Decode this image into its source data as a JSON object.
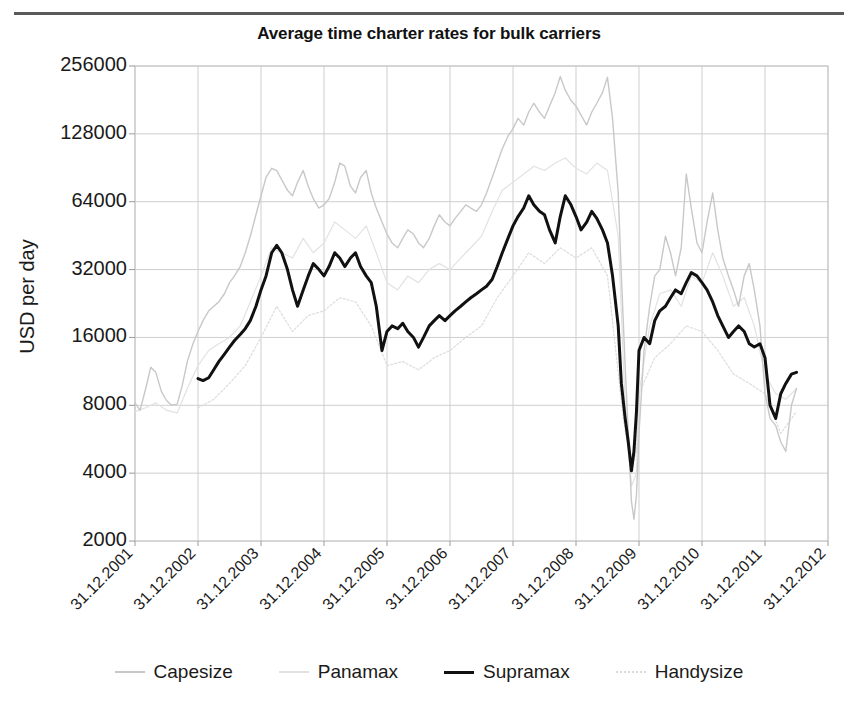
{
  "chart_data": {
    "type": "line",
    "title": "Average time charter rates for bulk carriers",
    "xlabel": "",
    "ylabel": "USD per day",
    "yscale": "log2",
    "ylim": [
      2000,
      256000
    ],
    "yticks": [
      2000,
      4000,
      8000,
      16000,
      32000,
      64000,
      128000,
      256000
    ],
    "ytick_labels": [
      "2000",
      "4000",
      "8000",
      "16000",
      "32000",
      "64000",
      "128000",
      "256000"
    ],
    "xticks": [
      2001,
      2002,
      2003,
      2004,
      2005,
      2006,
      2007,
      2008,
      2009,
      2010,
      2011,
      2012
    ],
    "xtick_labels": [
      "31.12.2001",
      "31.12.2002",
      "31.12.2003",
      "31.12.2004",
      "31.12.2005",
      "31.12.2006",
      "31.12.2007",
      "31.12.2008",
      "31.12.2009",
      "31.12.2010",
      "31.12.2011",
      "31.12.2012"
    ],
    "xlim": [
      2001.0,
      2012.0
    ],
    "grid": true,
    "legend_position": "bottom",
    "series": [
      {
        "name": "Capesize",
        "color": "#c8c8c8",
        "width": 1.4,
        "dash": "none",
        "x": [
          2001.0,
          2001.08,
          2001.17,
          2001.25,
          2001.33,
          2001.42,
          2001.5,
          2001.58,
          2001.67,
          2001.75,
          2001.83,
          2001.92,
          2002.0,
          2002.08,
          2002.17,
          2002.25,
          2002.33,
          2002.42,
          2002.5,
          2002.58,
          2002.67,
          2002.75,
          2002.83,
          2002.92,
          2003.0,
          2003.08,
          2003.17,
          2003.25,
          2003.33,
          2003.42,
          2003.5,
          2003.58,
          2003.67,
          2003.75,
          2003.83,
          2003.92,
          2004.0,
          2004.08,
          2004.17,
          2004.25,
          2004.33,
          2004.42,
          2004.5,
          2004.58,
          2004.67,
          2004.75,
          2004.83,
          2004.92,
          2005.0,
          2005.08,
          2005.17,
          2005.25,
          2005.33,
          2005.42,
          2005.5,
          2005.58,
          2005.67,
          2005.75,
          2005.83,
          2005.92,
          2006.0,
          2006.08,
          2006.17,
          2006.25,
          2006.33,
          2006.42,
          2006.5,
          2006.58,
          2006.67,
          2006.75,
          2006.83,
          2006.92,
          2007.0,
          2007.08,
          2007.17,
          2007.25,
          2007.33,
          2007.42,
          2007.5,
          2007.58,
          2007.67,
          2007.75,
          2007.83,
          2007.92,
          2008.0,
          2008.08,
          2008.17,
          2008.25,
          2008.33,
          2008.42,
          2008.5,
          2008.58,
          2008.67,
          2008.72,
          2008.78,
          2008.83,
          2008.88,
          2008.92,
          2008.96,
          2009.0,
          2009.08,
          2009.17,
          2009.25,
          2009.33,
          2009.42,
          2009.5,
          2009.58,
          2009.67,
          2009.75,
          2009.83,
          2009.92,
          2010.0,
          2010.08,
          2010.17,
          2010.25,
          2010.33,
          2010.42,
          2010.5,
          2010.58,
          2010.67,
          2010.75,
          2010.83,
          2010.92,
          2011.0,
          2011.08,
          2011.17,
          2011.25,
          2011.33,
          2011.42,
          2011.5
        ],
        "y": [
          8200,
          7600,
          9500,
          11800,
          11200,
          9200,
          8400,
          8000,
          8100,
          9800,
          12500,
          15000,
          17000,
          19000,
          21000,
          22000,
          23000,
          25000,
          28000,
          30000,
          33000,
          38000,
          45000,
          56000,
          68000,
          82000,
          90000,
          88000,
          80000,
          72000,
          68000,
          78000,
          88000,
          75000,
          66000,
          60000,
          62000,
          66000,
          78000,
          95000,
          92000,
          75000,
          70000,
          82000,
          88000,
          70000,
          60000,
          52000,
          46000,
          42000,
          40000,
          44000,
          48000,
          46000,
          42000,
          40000,
          44000,
          50000,
          56000,
          52000,
          50000,
          54000,
          58000,
          62000,
          60000,
          58000,
          62000,
          70000,
          82000,
          95000,
          110000,
          125000,
          135000,
          150000,
          140000,
          160000,
          175000,
          160000,
          150000,
          170000,
          195000,
          230000,
          200000,
          180000,
          170000,
          155000,
          140000,
          160000,
          175000,
          195000,
          228000,
          150000,
          70000,
          30000,
          12000,
          6000,
          3000,
          2500,
          3200,
          6000,
          14000,
          22000,
          30000,
          32000,
          45000,
          38000,
          30000,
          40000,
          85000,
          60000,
          42000,
          38000,
          52000,
          70000,
          48000,
          36000,
          30000,
          26000,
          22000,
          30000,
          34000,
          26000,
          18000,
          9000,
          7000,
          6500,
          5500,
          5000,
          8000,
          9500
        ]
      },
      {
        "name": "Panamax",
        "color": "#e2e2e2",
        "width": 1.2,
        "dash": "none",
        "x": [
          2001.0,
          2001.17,
          2001.33,
          2001.5,
          2001.67,
          2001.83,
          2002.0,
          2002.17,
          2002.33,
          2002.5,
          2002.67,
          2002.83,
          2003.0,
          2003.17,
          2003.33,
          2003.5,
          2003.67,
          2003.83,
          2004.0,
          2004.17,
          2004.33,
          2004.5,
          2004.67,
          2004.83,
          2005.0,
          2005.17,
          2005.33,
          2005.5,
          2005.67,
          2005.83,
          2006.0,
          2006.17,
          2006.33,
          2006.5,
          2006.67,
          2006.83,
          2007.0,
          2007.17,
          2007.33,
          2007.5,
          2007.67,
          2007.83,
          2008.0,
          2008.17,
          2008.33,
          2008.5,
          2008.67,
          2008.78,
          2008.88,
          2008.96,
          2009.0,
          2009.17,
          2009.33,
          2009.5,
          2009.67,
          2009.83,
          2010.0,
          2010.17,
          2010.33,
          2010.5,
          2010.67,
          2010.83,
          2011.0,
          2011.17,
          2011.33,
          2011.5
        ],
        "y": [
          7500,
          7800,
          8200,
          7600,
          7400,
          9500,
          12000,
          14000,
          15000,
          16000,
          18000,
          23000,
          30000,
          40000,
          38000,
          36000,
          44000,
          38000,
          42000,
          52000,
          48000,
          44000,
          50000,
          38000,
          28000,
          26000,
          30000,
          28000,
          32000,
          34000,
          32000,
          36000,
          40000,
          45000,
          58000,
          72000,
          78000,
          85000,
          92000,
          88000,
          95000,
          100000,
          90000,
          85000,
          95000,
          88000,
          45000,
          8000,
          3500,
          4000,
          9000,
          18000,
          25000,
          26000,
          22000,
          30000,
          28000,
          38000,
          30000,
          22000,
          24000,
          18000,
          11000,
          9000,
          8500,
          9500
        ]
      },
      {
        "name": "Supramax",
        "color": "#111111",
        "width": 3.0,
        "dash": "none",
        "x": [
          2002.0,
          2002.08,
          2002.17,
          2002.25,
          2002.33,
          2002.42,
          2002.5,
          2002.58,
          2002.67,
          2002.75,
          2002.83,
          2002.92,
          2003.0,
          2003.08,
          2003.17,
          2003.25,
          2003.33,
          2003.42,
          2003.5,
          2003.58,
          2003.67,
          2003.75,
          2003.83,
          2003.92,
          2004.0,
          2004.08,
          2004.17,
          2004.25,
          2004.33,
          2004.42,
          2004.5,
          2004.58,
          2004.67,
          2004.75,
          2004.83,
          2004.92,
          2005.0,
          2005.08,
          2005.17,
          2005.25,
          2005.33,
          2005.42,
          2005.5,
          2005.58,
          2005.67,
          2005.75,
          2005.83,
          2005.92,
          2006.0,
          2006.08,
          2006.17,
          2006.25,
          2006.33,
          2006.42,
          2006.5,
          2006.58,
          2006.67,
          2006.75,
          2006.83,
          2006.92,
          2007.0,
          2007.08,
          2007.17,
          2007.25,
          2007.33,
          2007.42,
          2007.5,
          2007.58,
          2007.67,
          2007.75,
          2007.83,
          2007.92,
          2008.0,
          2008.08,
          2008.17,
          2008.25,
          2008.33,
          2008.42,
          2008.5,
          2008.58,
          2008.67,
          2008.72,
          2008.78,
          2008.83,
          2008.88,
          2008.92,
          2008.96,
          2009.0,
          2009.08,
          2009.17,
          2009.25,
          2009.33,
          2009.42,
          2009.5,
          2009.58,
          2009.67,
          2009.75,
          2009.83,
          2009.92,
          2010.0,
          2010.08,
          2010.17,
          2010.25,
          2010.33,
          2010.42,
          2010.5,
          2010.58,
          2010.67,
          2010.75,
          2010.83,
          2010.92,
          2011.0,
          2011.08,
          2011.17,
          2011.25,
          2011.33,
          2011.42,
          2011.5
        ],
        "y": [
          10500,
          10300,
          10600,
          11500,
          12500,
          13500,
          14500,
          15500,
          16500,
          17500,
          19000,
          22000,
          26000,
          30000,
          38000,
          41000,
          38000,
          32000,
          26000,
          22000,
          26000,
          30000,
          34000,
          32000,
          30000,
          33000,
          38000,
          36000,
          33000,
          36000,
          38000,
          33000,
          30000,
          28000,
          22000,
          14000,
          17000,
          18000,
          17500,
          18500,
          17000,
          16000,
          14500,
          16000,
          18000,
          19000,
          20000,
          19000,
          20000,
          21000,
          22000,
          23000,
          24000,
          25000,
          26000,
          27000,
          29000,
          33000,
          38000,
          44000,
          50000,
          55000,
          60000,
          68000,
          62000,
          58000,
          56000,
          48000,
          42000,
          55000,
          68000,
          62000,
          55000,
          48000,
          52000,
          58000,
          54000,
          48000,
          42000,
          30000,
          18000,
          10000,
          7000,
          5500,
          4100,
          5000,
          7500,
          14000,
          16000,
          15000,
          19000,
          21000,
          22000,
          24000,
          26000,
          25000,
          28000,
          31000,
          30000,
          28000,
          26000,
          23000,
          20000,
          18000,
          16000,
          17000,
          18000,
          17000,
          15000,
          14500,
          15000,
          13000,
          8000,
          7000,
          9000,
          10000,
          11000,
          11200
        ]
      },
      {
        "name": "Handysize",
        "color": "#dcdcdc",
        "width": 1.2,
        "dash": "2,2",
        "x": [
          2002.0,
          2002.25,
          2002.5,
          2002.75,
          2003.0,
          2003.25,
          2003.5,
          2003.75,
          2004.0,
          2004.25,
          2004.5,
          2004.75,
          2005.0,
          2005.25,
          2005.5,
          2005.75,
          2006.0,
          2006.25,
          2006.5,
          2006.75,
          2007.0,
          2007.25,
          2007.5,
          2007.75,
          2008.0,
          2008.25,
          2008.5,
          2008.75,
          2008.88,
          2008.96,
          2009.0,
          2009.25,
          2009.5,
          2009.75,
          2010.0,
          2010.25,
          2010.5,
          2010.75,
          2011.0,
          2011.25,
          2011.5
        ],
        "y": [
          7800,
          8500,
          10000,
          12000,
          16000,
          22000,
          17000,
          20000,
          21000,
          24000,
          23000,
          18000,
          12000,
          12500,
          11500,
          13000,
          14000,
          16000,
          18000,
          24000,
          30000,
          38000,
          34000,
          40000,
          36000,
          40000,
          30000,
          7000,
          4200,
          5000,
          9000,
          13000,
          15000,
          18000,
          17000,
          14000,
          11000,
          10000,
          9000,
          6000,
          7500
        ]
      }
    ]
  },
  "legend": {
    "items": [
      {
        "label": "Capesize"
      },
      {
        "label": "Panamax"
      },
      {
        "label": "Supramax"
      },
      {
        "label": "Handysize"
      }
    ]
  }
}
